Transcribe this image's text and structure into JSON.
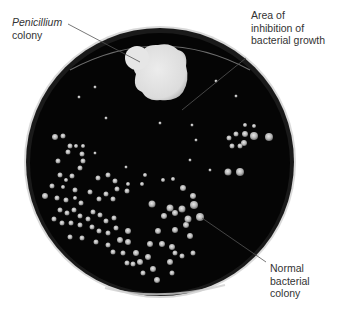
{
  "figure": {
    "labels": {
      "penicillium": {
        "line1": "Penicillium",
        "line2": "colony"
      },
      "inhibition": {
        "line1": "Area of",
        "line2": "inhibition of",
        "line3": "bacterial growth"
      },
      "bacterial": {
        "line1": "Normal",
        "line2": "bacterial",
        "line3": "colony"
      }
    },
    "colors": {
      "background": "#ffffff",
      "agar": "#050505",
      "rim": "#cfcfcf",
      "penicillium": "#e4e4e4",
      "bacteria": "#bdbdbd",
      "leader_line": "#555555",
      "text": "#333333"
    }
  }
}
